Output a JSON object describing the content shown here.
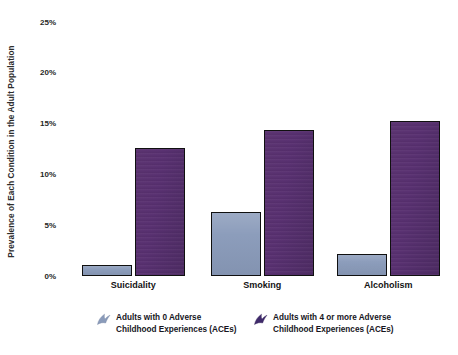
{
  "chart_data": {
    "type": "bar",
    "title": "",
    "xlabel": "",
    "ylabel": "Prevalence of Each Condition in the Adult Population",
    "ylim": [
      0,
      25
    ],
    "ytick_labels": [
      "25%",
      "20%",
      "15%",
      "10%",
      "5%",
      "0%"
    ],
    "ytick_values": [
      25,
      20,
      15,
      10,
      5,
      0
    ],
    "grid": false,
    "legend_position": "bottom",
    "categories": [
      "Suicidality",
      "Smoking",
      "Alcoholism"
    ],
    "series": [
      {
        "name": "Adults with 0 Adverse Childhood Experiences (ACEs)",
        "color": "#8a9bba",
        "values": [
          1.1,
          6.3,
          2.2
        ]
      },
      {
        "name": "Adults with 4 or more Adverse Childhood Experiences (ACEs)",
        "color": "#583070",
        "values": [
          12.6,
          14.4,
          15.3
        ]
      }
    ]
  },
  "legend": {
    "entries": [
      {
        "marker": "flag-marker-icon",
        "line1": "Adults with 0 Adverse",
        "line2": "Childhood Experiences (ACEs)",
        "color": "#8a9bba"
      },
      {
        "marker": "flag-marker-icon",
        "line1": "Adults with 4 or more Adverse",
        "line2": "Childhood Experiences (ACEs)",
        "color": "#3f2a6b"
      }
    ]
  }
}
